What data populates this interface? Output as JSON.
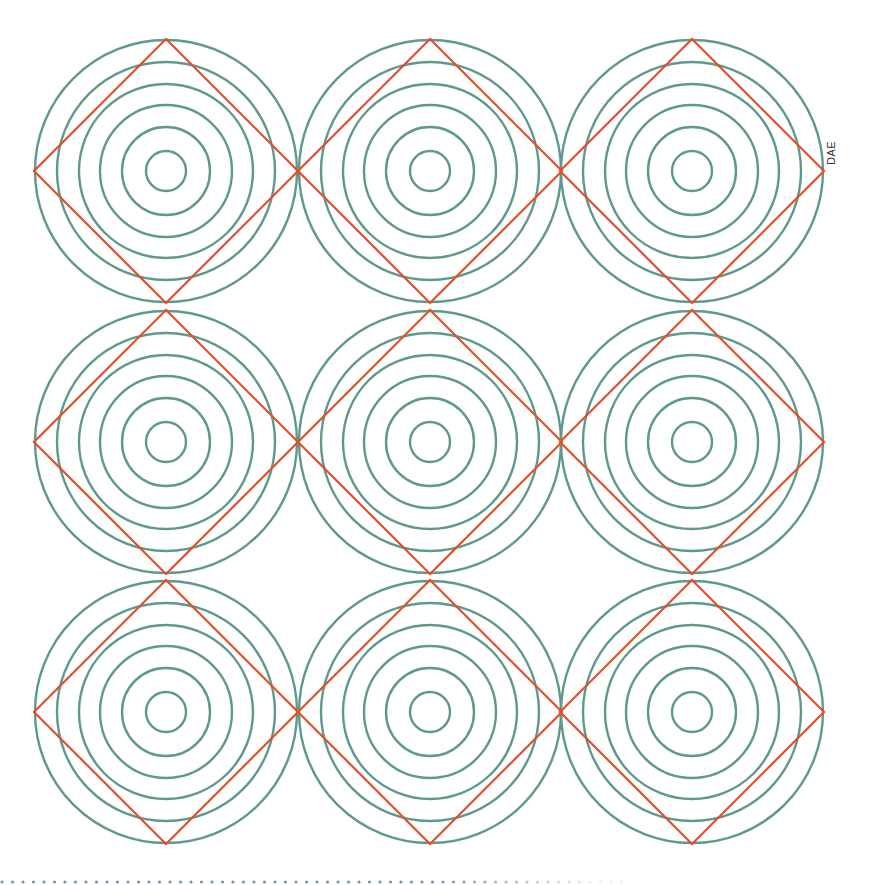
{
  "figure": {
    "label": "DAE",
    "grid": {
      "rows": 3,
      "cols": 3
    },
    "col_centers": [
      166,
      430,
      692
    ],
    "row_centers": [
      171,
      442,
      712
    ],
    "ring_radii": [
      131,
      109,
      87,
      66,
      44,
      20
    ],
    "diamond_half_diagonal": 132,
    "colors": {
      "rings": "#5e9a8c",
      "diamond": "#e2502a",
      "dots": "#6f9f93",
      "background": "#ffffff"
    },
    "dotted_line": {
      "y": 882,
      "x_start": 2,
      "x_end": 625,
      "spacing": 10.5,
      "dot_radius": 1.6
    }
  }
}
